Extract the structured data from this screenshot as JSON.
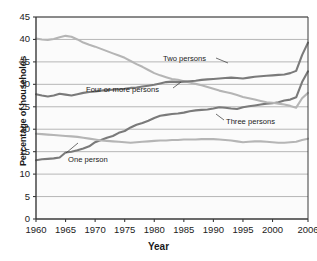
{
  "chart_data": {
    "type": "line",
    "title": "",
    "xlabel": "Year",
    "ylabel": "Percentage of households",
    "xlim": [
      1960,
      2006
    ],
    "ylim": [
      0,
      45
    ],
    "ytick_step": 5,
    "xtick_step": 5,
    "grid": true,
    "grid_axis": "y",
    "legend": "inline-annotations",
    "xticks": [
      "1960",
      "1965",
      "1970",
      "1975",
      "1980",
      "1985",
      "1990",
      "1995",
      "2000",
      "2006"
    ],
    "xtick_values": [
      1960,
      1965,
      1970,
      1975,
      1980,
      1985,
      1990,
      1995,
      2000,
      2006
    ],
    "yticks": [
      "0",
      "5",
      "10",
      "15",
      "20",
      "25",
      "30",
      "35",
      "40",
      "45"
    ],
    "ytick_values": [
      0,
      5,
      10,
      15,
      20,
      25,
      30,
      35,
      40,
      45
    ],
    "x": [
      1960,
      1961,
      1962,
      1963,
      1964,
      1965,
      1966,
      1967,
      1968,
      1969,
      1970,
      1971,
      1972,
      1973,
      1974,
      1975,
      1976,
      1977,
      1978,
      1979,
      1980,
      1981,
      1982,
      1983,
      1984,
      1985,
      1986,
      1987,
      1988,
      1989,
      1990,
      1991,
      1992,
      1993,
      1994,
      1995,
      1996,
      1997,
      1998,
      1999,
      2000,
      2001,
      2002,
      2003,
      2004,
      2005,
      2006
    ],
    "series": [
      {
        "name": "One person",
        "color": "#7a7a7a",
        "annotation": "One person",
        "values": [
          13.1,
          13.3,
          13.4,
          13.5,
          13.7,
          14.8,
          15.0,
          15.3,
          15.7,
          16.2,
          17.1,
          17.6,
          18.1,
          18.5,
          19.2,
          19.6,
          20.4,
          21.0,
          21.4,
          21.9,
          22.5,
          23.0,
          23.2,
          23.4,
          23.5,
          23.7,
          24.0,
          24.2,
          24.3,
          24.4,
          24.6,
          24.9,
          24.8,
          24.6,
          24.5,
          24.9,
          25.1,
          25.3,
          25.5,
          25.7,
          25.8,
          26.0,
          26.4,
          26.6,
          27.1,
          30.5,
          32.9
        ]
      },
      {
        "name": "Two persons",
        "color": "#b5b5b5",
        "annotation": "Two persons",
        "values": [
          40.2,
          40.0,
          39.9,
          40.1,
          40.5,
          40.8,
          40.6,
          40.0,
          39.3,
          38.8,
          38.4,
          37.9,
          37.4,
          36.9,
          36.4,
          35.9,
          35.2,
          34.5,
          33.9,
          33.2,
          32.5,
          32.0,
          31.6,
          31.2,
          31.0,
          30.7,
          30.4,
          30.1,
          29.8,
          29.4,
          29.0,
          28.6,
          28.3,
          28.0,
          27.6,
          27.2,
          26.9,
          26.6,
          26.3,
          26.0,
          25.9,
          25.7,
          25.5,
          25.2,
          24.8,
          26.9,
          28.1
        ]
      },
      {
        "name": "Three persons",
        "color": "#b5b5b5",
        "annotation": "Three persons",
        "values": [
          19.0,
          18.9,
          18.8,
          18.7,
          18.6,
          18.5,
          18.4,
          18.3,
          18.1,
          17.9,
          17.7,
          17.5,
          17.4,
          17.3,
          17.2,
          17.1,
          17.0,
          17.1,
          17.2,
          17.3,
          17.4,
          17.5,
          17.5,
          17.6,
          17.6,
          17.7,
          17.7,
          17.7,
          17.8,
          17.8,
          17.8,
          17.7,
          17.6,
          17.5,
          17.3,
          17.1,
          17.2,
          17.3,
          17.3,
          17.2,
          17.1,
          17.0,
          17.0,
          17.1,
          17.2,
          17.6,
          17.9
        ]
      },
      {
        "name": "Four or more persons",
        "color": "#7a7a7a",
        "annotation": "Four or more persons",
        "values": [
          27.8,
          27.5,
          27.3,
          27.5,
          27.9,
          27.7,
          27.5,
          27.8,
          28.1,
          28.3,
          28.4,
          28.6,
          28.7,
          28.8,
          28.9,
          29.0,
          29.2,
          29.3,
          29.5,
          29.7,
          29.9,
          30.2,
          30.5,
          30.6,
          30.5,
          30.6,
          30.7,
          30.8,
          31.0,
          31.1,
          31.2,
          31.3,
          31.4,
          31.5,
          31.4,
          31.3,
          31.5,
          31.7,
          31.8,
          31.9,
          32.0,
          32.1,
          32.2,
          32.5,
          33.0,
          36.5,
          39.3
        ]
      }
    ],
    "annotations": [
      {
        "text": "Two persons",
        "x_px": 163,
        "y_px": 54
      },
      {
        "text": "Four or more persons",
        "x_px": 86,
        "y_px": 85
      },
      {
        "text": "Three persons",
        "x_px": 226,
        "y_px": 117
      },
      {
        "text": "One person",
        "x_px": 68,
        "y_px": 155
      }
    ]
  },
  "colors": {
    "axis": "#3a3a3a",
    "grid": "#9a9a9a",
    "plot_bg": "#fbfbfb",
    "text": "#1a1a1a",
    "dark_series": "#7a7a7a",
    "light_series": "#b5b5b5"
  }
}
